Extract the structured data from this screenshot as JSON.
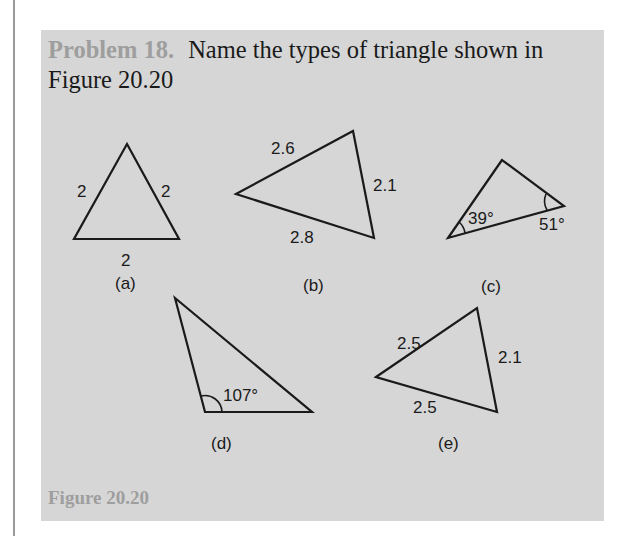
{
  "problem": {
    "label": "Problem 18.",
    "text": "Name the types of triangle shown in Figure 20.20"
  },
  "figure": {
    "caption": "Figure 20.20",
    "triangles": [
      {
        "id": "a",
        "label": "(a)",
        "sides": [
          "2",
          "2",
          "2"
        ],
        "angles": []
      },
      {
        "id": "b",
        "label": "(b)",
        "sides": [
          "2.6",
          "2.1",
          "2.8"
        ],
        "angles": []
      },
      {
        "id": "c",
        "label": "(c)",
        "sides": [],
        "angles": [
          "39°",
          "51°"
        ]
      },
      {
        "id": "d",
        "label": "(d)",
        "sides": [],
        "angles": [
          "107°"
        ]
      },
      {
        "id": "e",
        "label": "(e)",
        "sides": [
          "2.5",
          "2.1",
          "2.5"
        ],
        "angles": []
      }
    ]
  },
  "colors": {
    "panel": "#d6d6d6",
    "label_gray": "#9e9e9e",
    "ink": "#1a1a1a"
  }
}
